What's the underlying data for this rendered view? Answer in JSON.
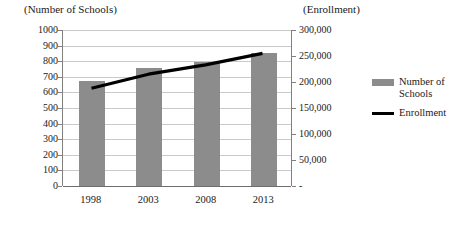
{
  "chart_data": {
    "type": "bar",
    "title": "",
    "categories": [
      "1998",
      "2003",
      "2008",
      "2013"
    ],
    "xlabel": "",
    "left_axis": {
      "label": "(Number of Schools)",
      "ticks": [
        "0",
        "100",
        "200",
        "300",
        "400",
        "500",
        "600",
        "700",
        "800",
        "900",
        "1000"
      ],
      "ylim": [
        0,
        1000
      ],
      "step": 100
    },
    "right_axis": {
      "label": "(Enrollment)",
      "ticks": [
        "-",
        "50,000",
        "100,000",
        "150,000",
        "200,000",
        "250,000",
        "300,000"
      ],
      "ylim": [
        0,
        300000
      ],
      "step": 50000
    },
    "series": [
      {
        "name": "Number of Schools",
        "type": "bar",
        "axis": "left",
        "color": "#8c8c8c",
        "values": [
          670,
          755,
          795,
          855
        ]
      },
      {
        "name": "Enrollment",
        "type": "line",
        "axis": "right",
        "color": "#000000",
        "values": [
          188000,
          215000,
          233000,
          255000
        ]
      }
    ],
    "legend": {
      "position": "right",
      "entries": [
        {
          "label": "Number of Schools",
          "marker": "bar-swatch",
          "color": "#8c8c8c"
        },
        {
          "label": "Enrollment",
          "marker": "line-swatch",
          "color": "#000000"
        }
      ]
    },
    "grid": true
  }
}
